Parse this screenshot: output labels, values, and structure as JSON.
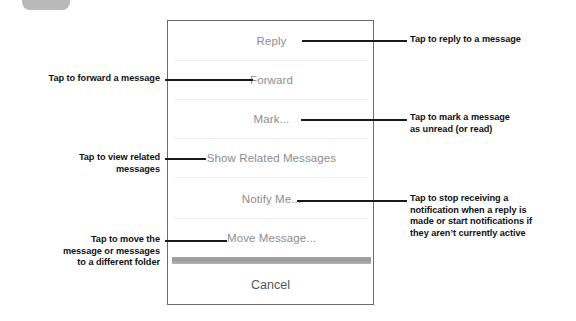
{
  "figure": {
    "title": "Annotated iOS message action sheet"
  },
  "top_tab": {
    "icon": "rounded-tab-shape"
  },
  "panel": {
    "menu_items": [
      {
        "id": "reply",
        "label": "Reply"
      },
      {
        "id": "forward",
        "label": "Forward"
      },
      {
        "id": "mark",
        "label": "Mark..."
      },
      {
        "id": "show-related",
        "label": "Show Related Messages"
      },
      {
        "id": "notify-me",
        "label": "Notify Me..."
      },
      {
        "id": "move-message",
        "label": "Move Message..."
      }
    ],
    "cancel_label": "Cancel"
  },
  "annotations": {
    "reply": "Tap to reply to a message",
    "forward": "Tap to forward a message",
    "mark": "Tap to mark a message\nas unread (or read)",
    "mark_l1": "Tap to mark a message",
    "mark_l2": "as unread (or read)",
    "related_l1": "Tap to view related",
    "related_l2": "messages",
    "notify_l1": "Tap to stop receiving a",
    "notify_l2": "notification when a reply is",
    "notify_l3": "made or start notifications if",
    "notify_l4": "they aren’t currently active",
    "move_l1": "Tap to move the",
    "move_l2": "message or messages",
    "move_l3": "to a different folder"
  },
  "colors": {
    "menu_text": "#8d8d8d",
    "cancel_text": "#555555",
    "annotation_text": "#111111",
    "panel_border": "#6b6b6b",
    "thick_divider": "#a3a3a3",
    "top_tab": "#b9b9b9"
  }
}
